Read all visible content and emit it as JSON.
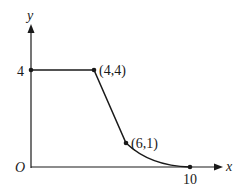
{
  "axes": {
    "x_label": "x",
    "y_label": "y",
    "origin_label": "O"
  },
  "ticks": {
    "y_tick": "4",
    "x_tick": "10"
  },
  "points": [
    {
      "label": "(4,4)",
      "x": 4,
      "y": 4
    },
    {
      "label": "(6,1)",
      "x": 6,
      "y": 1
    },
    {
      "label": "",
      "x": 10,
      "y": 0
    },
    {
      "label": "",
      "x": 0,
      "y": 4
    }
  ],
  "curve": {
    "segments": [
      {
        "type": "line",
        "from": [
          0,
          4
        ],
        "to": [
          4,
          4
        ]
      },
      {
        "type": "line",
        "from": [
          4,
          4
        ],
        "to": [
          6,
          1
        ]
      },
      {
        "type": "curve",
        "from": [
          6,
          1
        ],
        "to": [
          10,
          0
        ]
      }
    ]
  },
  "colors": {
    "stroke": "#1a1a1a"
  }
}
